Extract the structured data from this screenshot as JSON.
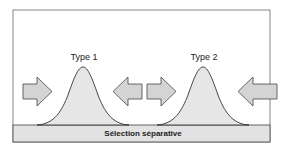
{
  "diagram": {
    "title": "",
    "populations": [
      {
        "label": "Type 1"
      },
      {
        "label": "Type 2"
      }
    ],
    "bar_label": "Sélection séparative",
    "arrows": [
      {
        "direction": "right",
        "position": "left of Type 1"
      },
      {
        "direction": "left",
        "position": "right of Type 1"
      },
      {
        "direction": "right",
        "position": "left of Type 2"
      },
      {
        "direction": "left",
        "position": "right of Type 2"
      }
    ],
    "colors": {
      "frame": "#555555",
      "curve_fill": "#e6e6e6",
      "curve_stroke": "#333333",
      "arrow_fill": "#d4d4d4",
      "arrow_stroke": "#444444",
      "bar_fill": "#e2e2e2"
    }
  }
}
